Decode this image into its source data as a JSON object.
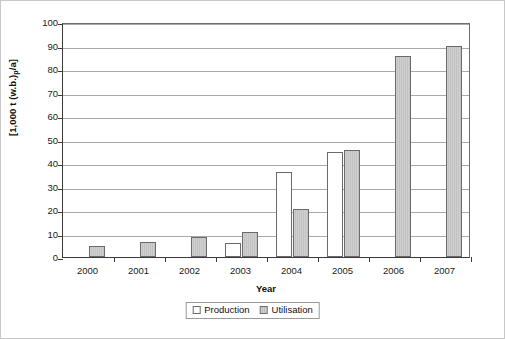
{
  "chart_data": {
    "type": "bar",
    "title": "",
    "xlabel": "Year",
    "ylabel": "[1,000 t (w.b.)p/a]",
    "ylabel_main": "[1,000 t (w.b.)",
    "ylabel_sub": "p",
    "ylabel_tail": "/a]",
    "categories": [
      "2000",
      "2001",
      "2002",
      "2003",
      "2004",
      "2005",
      "2006",
      "2007"
    ],
    "series": [
      {
        "name": "Production",
        "swatch": "white-square",
        "values": [
          0,
          0,
          0,
          6,
          36,
          44.7,
          0,
          0
        ]
      },
      {
        "name": "Utilisation",
        "swatch": "gray-hatched-square",
        "values": [
          4.5,
          6.5,
          8.5,
          10.5,
          20.5,
          45.5,
          85.5,
          89.8
        ]
      }
    ],
    "ylim": [
      0,
      100
    ],
    "yticks": [
      0,
      10,
      20,
      30,
      40,
      50,
      60,
      70,
      80,
      90,
      100
    ],
    "ytick_labels": [
      "0",
      "10",
      "20",
      "30",
      "40",
      "50",
      "60",
      "70",
      "80",
      "90",
      "100"
    ],
    "grid": "horizontal",
    "legend_position": "bottom-center",
    "colors": {
      "production_fill": "#ffffff",
      "utilisation_fill": "#cfcfcf",
      "bar_border": "#6a6a6a",
      "gridline": "#a9a9a9",
      "axis": "#3a3a3a",
      "text": "#111111",
      "background": "#ffffff"
    }
  },
  "legend": {
    "entries": [
      {
        "label": "Production"
      },
      {
        "label": "Utilisation"
      }
    ]
  }
}
